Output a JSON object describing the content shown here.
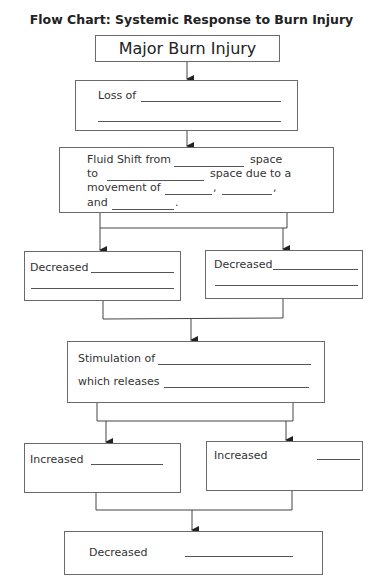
{
  "title": "Flow Chart:  Systemic Response to Burn Injury",
  "nodes": {
    "start": {
      "label": "Major Burn Injury"
    },
    "loss": {
      "label": "Loss of"
    },
    "fluid_shift": {
      "line1_a": "Fluid Shift from",
      "line1_b": "space",
      "line2_a": "to",
      "line2_b": "space due to a",
      "line3_a": "movement of",
      "line3_b": ",",
      "line3_c": ",",
      "line4_a": "and",
      "line4_b": "."
    },
    "decreased_left": {
      "label": "Decreased"
    },
    "decreased_right": {
      "label": "Decreased"
    },
    "stimulation": {
      "line1": "Stimulation of",
      "line2": "which releases"
    },
    "increased_left": {
      "label": "Increased"
    },
    "increased_right": {
      "label": "Increased"
    },
    "decreased_final": {
      "label": "Decreased"
    }
  },
  "edges": [
    [
      "start",
      "loss"
    ],
    [
      "loss",
      "fluid_shift"
    ],
    [
      "fluid_shift",
      "decreased_left"
    ],
    [
      "fluid_shift",
      "decreased_right"
    ],
    [
      "decreased_left",
      "stimulation"
    ],
    [
      "decreased_right",
      "stimulation"
    ],
    [
      "stimulation",
      "increased_left"
    ],
    [
      "stimulation",
      "increased_right"
    ],
    [
      "increased_left",
      "decreased_final"
    ],
    [
      "increased_right",
      "decreased_final"
    ]
  ]
}
